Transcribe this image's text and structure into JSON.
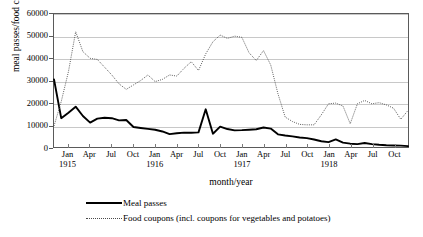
{
  "chart_data": {
    "type": "line",
    "title": "",
    "xlabel": "month/year",
    "ylabel": "meal passes/food coupons",
    "ylim": [
      0,
      60000
    ],
    "yticks": [
      0,
      10000,
      20000,
      30000,
      40000,
      50000,
      60000
    ],
    "ytick_labels": [
      "0",
      "10000",
      "20000",
      "30000",
      "40000",
      "50000",
      "60000"
    ],
    "grid": true,
    "legend_position": "bottom",
    "x_major_labels": [
      "Jan",
      "Apr",
      "Jul",
      "Oct",
      "Jan",
      "Apr",
      "Jul",
      "Oct",
      "Jan",
      "Apr",
      "Jul",
      "Oct",
      "Jan",
      "Apr",
      "Jul",
      "Oct"
    ],
    "x_year_groups": [
      "1915",
      "1916",
      "1917",
      "1918"
    ],
    "x": [
      "Nov 1914",
      "Dec 1914",
      "Jan 1915",
      "Feb 1915",
      "Mar 1915",
      "Apr 1915",
      "May 1915",
      "Jun 1915",
      "Jul 1915",
      "Aug 1915",
      "Sep 1915",
      "Oct 1915",
      "Nov 1915",
      "Dec 1915",
      "Jan 1916",
      "Feb 1916",
      "Mar 1916",
      "Apr 1916",
      "May 1916",
      "Jun 1916",
      "Jul 1916",
      "Aug 1916",
      "Sep 1916",
      "Oct 1916",
      "Nov 1916",
      "Dec 1916",
      "Jan 1917",
      "Feb 1917",
      "Mar 1917",
      "Apr 1917",
      "May 1917",
      "Jun 1917",
      "Jul 1917",
      "Aug 1917",
      "Sep 1917",
      "Oct 1917",
      "Nov 1917",
      "Dec 1917",
      "Jan 1918",
      "Feb 1918",
      "Mar 1918",
      "Apr 1918",
      "May 1918",
      "Jun 1918",
      "Jul 1918",
      "Aug 1918",
      "Sep 1918",
      "Oct 1918",
      "Nov 1918",
      "Dec 1918"
    ],
    "series": [
      {
        "name": "Meal passes",
        "style": "solid",
        "color": "#000000",
        "values": [
          30500,
          13000,
          15500,
          18200,
          14000,
          11000,
          12800,
          13200,
          13000,
          12000,
          12200,
          9000,
          8600,
          8200,
          7800,
          7000,
          5800,
          6200,
          6500,
          6400,
          6600,
          17000,
          6000,
          9200,
          8100,
          7500,
          7600,
          7800,
          8000,
          8800,
          8300,
          5700,
          5200,
          4800,
          4300,
          4000,
          3400,
          2600,
          2200,
          3400,
          2000,
          1500,
          1300,
          1800,
          1300,
          1000,
          800,
          700,
          600,
          400
        ]
      },
      {
        "name": "Food coupons (incl. coupons for vegetables and potatoes)",
        "style": "dotted",
        "color": "#4a4a4a",
        "values": [
          9500,
          20500,
          34000,
          52000,
          43000,
          40000,
          39500,
          36000,
          32500,
          28500,
          26000,
          28000,
          30000,
          32500,
          29500,
          30500,
          32500,
          32000,
          35500,
          38500,
          34500,
          42000,
          47500,
          50500,
          49000,
          50000,
          49500,
          42500,
          39000,
          43500,
          37000,
          24000,
          13500,
          11500,
          10200,
          10000,
          10000,
          14500,
          19500,
          19800,
          18500,
          10500,
          19500,
          21000,
          19500,
          20000,
          19000,
          17500,
          12500,
          16500
        ]
      }
    ]
  },
  "axis_titles": {
    "y": "meal passes/food coupons",
    "x": "month/year"
  },
  "legend": {
    "items": [
      {
        "label": "Meal passes",
        "key": "solid-line-key"
      },
      {
        "label": "Food coupons (incl. coupons for vegetables and potatoes)",
        "key": "dotted-line-key"
      }
    ]
  }
}
